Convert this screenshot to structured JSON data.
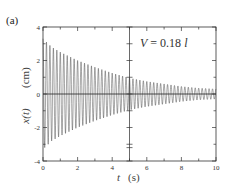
{
  "panel": {
    "label": "(a)"
  },
  "annotation": {
    "var": "V",
    "eq": " = 0.18 ",
    "unit": "l"
  },
  "chart_data": {
    "type": "line",
    "title": "",
    "panel_label": "(a)",
    "annotation": "V = 0.18 l",
    "xlabel": "t  (s)",
    "ylabel": "x(t)  (cm)",
    "xlim": [
      0,
      10
    ],
    "ylim": [
      -4,
      4
    ],
    "xticks": [
      0,
      2,
      4,
      6,
      8,
      10
    ],
    "yticks": [
      -4,
      -2,
      0,
      2,
      4
    ],
    "grid": false,
    "reference_lines": {
      "horizontal": 0,
      "vertical": 5
    },
    "series": [
      {
        "name": "x(t)",
        "description": "damped oscillation",
        "envelope_t": [
          0,
          0.5,
          1,
          2,
          3,
          4,
          5,
          6,
          7,
          8,
          9,
          10
        ],
        "envelope_amplitude": [
          3.3,
          2.8,
          2.5,
          2.0,
          1.6,
          1.25,
          0.95,
          0.75,
          0.6,
          0.45,
          0.35,
          0.3
        ],
        "approx_period_s": 0.2
      }
    ]
  },
  "axes": {
    "xtick_labels": [
      "0",
      "2",
      "4",
      "6",
      "8",
      "10"
    ],
    "ytick_labels": [
      "-4",
      "-2",
      "0",
      "2",
      "4"
    ],
    "xlabel_var": "t",
    "xlabel_unit": "(s)",
    "ylabel_var": "x(t)",
    "ylabel_unit": "(cm)"
  }
}
